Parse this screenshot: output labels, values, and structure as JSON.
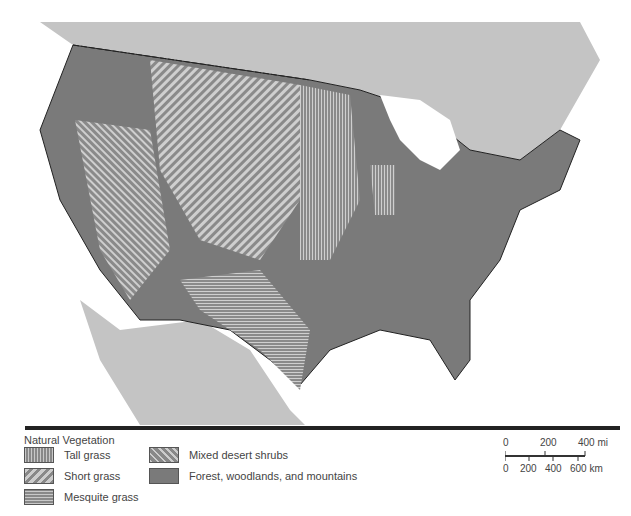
{
  "map": {
    "region": "Contiguous United States",
    "colors": {
      "forest": "#7a7a7a",
      "grass_light": "#c8c8c8",
      "neighbor_land": "#c4c4c4",
      "water": "#ffffff",
      "border": "#222222"
    }
  },
  "legend": {
    "title": "Natural Vegetation",
    "items": [
      {
        "label": "Tall grass",
        "pattern": "vertical-lines"
      },
      {
        "label": "Short grass",
        "pattern": "diagonal-lines"
      },
      {
        "label": "Mesquite grass",
        "pattern": "horizontal-lines"
      },
      {
        "label": "Mixed desert shrubs",
        "pattern": "dense-diagonal-lines"
      },
      {
        "label": "Forest, woodlands, and mountains",
        "pattern": "solid-dark-gray"
      }
    ]
  },
  "scale": {
    "mi_labels": [
      "0",
      "200",
      "400 mi"
    ],
    "km_labels": [
      "0",
      "200",
      "400",
      "600 km"
    ]
  }
}
